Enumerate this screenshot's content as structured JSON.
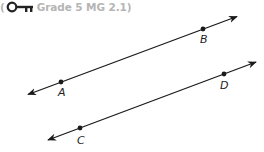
{
  "header": {
    "open_paren": "(",
    "key_icon": "key-icon",
    "standard": "Grade 5 MG 2.1)",
    "text_color": "#b5b5b5",
    "icon_color": "#222222"
  },
  "diagram": {
    "line_color": "#1a1a1a",
    "lines": [
      {
        "name": "line AB",
        "points": [
          {
            "label": "A",
            "x": 61,
            "y": 82
          },
          {
            "label": "B",
            "x": 203,
            "y": 27
          }
        ]
      },
      {
        "name": "line CD",
        "points": [
          {
            "label": "C",
            "x": 80,
            "y": 127
          },
          {
            "label": "D",
            "x": 224,
            "y": 73
          }
        ]
      }
    ],
    "labels": {
      "A": "A",
      "B": "B",
      "C": "C",
      "D": "D"
    }
  }
}
